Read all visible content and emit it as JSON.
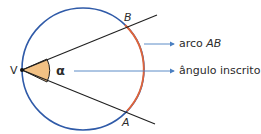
{
  "diagram": {
    "vertex_label": "V",
    "angle_symbol": "α",
    "point_b": "B",
    "point_a": "A",
    "callouts": [
      {
        "text": "arco ",
        "italic_part": "AB"
      },
      {
        "text": "ângulo inscrito",
        "italic_part": ""
      }
    ],
    "colors": {
      "circle": "#2f5aa8",
      "arc": "#e0643a",
      "angle_fill": "#f2c184",
      "lines": "#1f1f1f",
      "arrows": "#4a7fc1"
    }
  }
}
